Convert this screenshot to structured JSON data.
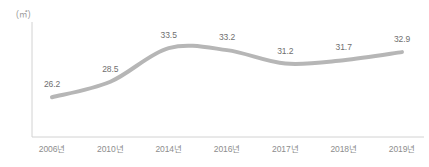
{
  "chart_data": {
    "type": "line",
    "title": "",
    "subtitle": "",
    "xlabel": "",
    "ylabel": "",
    "unit_label": "(㎡)",
    "categories": [
      "2006년",
      "2010년",
      "2014년",
      "2016년",
      "2017년",
      "2018년",
      "2019년"
    ],
    "values": [
      26.2,
      28.5,
      33.5,
      33.2,
      31.2,
      31.7,
      32.9
    ],
    "value_labels": [
      "26.2",
      "28.5",
      "33.5",
      "33.2",
      "31.2",
      "31.7",
      "32.9"
    ],
    "series": [
      {
        "name": "",
        "values": [
          26.2,
          28.5,
          33.5,
          33.2,
          31.2,
          31.7,
          32.9
        ]
      }
    ],
    "ylim": [
      24.0,
      35.0
    ],
    "grid": false,
    "legend": false,
    "legend_position": "none",
    "markers": false,
    "line_color": "#b6b6b6",
    "label_color": "#6f6f6f",
    "tick_color": "#8d8d8d",
    "axis_color": "#d2d2d2",
    "background_color": "#ffffff"
  },
  "axes": {
    "y_axis_name": "y-axis-line",
    "x_axis_name": "x-axis-line"
  }
}
